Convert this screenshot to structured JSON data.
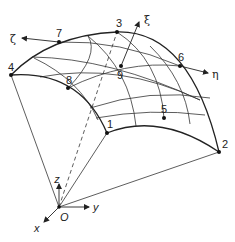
{
  "figure": {
    "nodes": [
      {
        "id": "1",
        "x": 107,
        "y": 133
      },
      {
        "id": "2",
        "x": 219,
        "y": 152
      },
      {
        "id": "3",
        "x": 117,
        "y": 32
      },
      {
        "id": "4",
        "x": 11,
        "y": 75
      },
      {
        "id": "5",
        "x": 164,
        "y": 118
      },
      {
        "id": "6",
        "x": 180,
        "y": 66
      },
      {
        "id": "7",
        "x": 59,
        "y": 42
      },
      {
        "id": "8",
        "x": 68,
        "y": 88
      },
      {
        "id": "9",
        "x": 121,
        "y": 66
      }
    ],
    "natural_axes": {
      "xi": "ξ",
      "eta": "η",
      "zeta": "ζ"
    },
    "global_axes": {
      "x": "x",
      "y": "y",
      "z": "z",
      "origin": "O"
    }
  }
}
